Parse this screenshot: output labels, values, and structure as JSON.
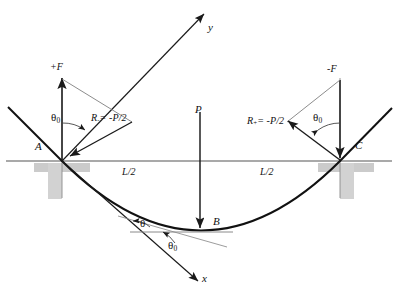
{
  "figure": {
    "background": "#ffffff",
    "stroke_dark": "#1a1a1a",
    "stroke_thin": "#555555",
    "support_fill": "#c9c9c9",
    "axis_color": "#4a4a4a"
  },
  "points": {
    "A": {
      "label": "A",
      "x": 62,
      "y": 161
    },
    "B": {
      "label": "B",
      "x": 200,
      "y": 230
    },
    "C": {
      "label": "C",
      "x": 340,
      "y": 161
    }
  },
  "axes": {
    "y_label": "y",
    "x_label": "x",
    "origin_x": 62,
    "origin_y": 161
  },
  "forces": {
    "left_vertical_label": "+F",
    "right_vertical_label": "-F",
    "load_label": "P",
    "left_reaction": {
      "symbol": "R",
      "subscript": "-",
      "equals": "= -P/2"
    },
    "right_reaction": {
      "symbol": "R",
      "subscript": "+",
      "equals": "= -P/2"
    }
  },
  "angles": {
    "left_theta0": {
      "symbol": "θ",
      "subscript": "0"
    },
    "right_theta0": {
      "symbol": "θ",
      "subscript": "0"
    },
    "bottom_theta": {
      "symbol": "θ"
    },
    "bottom_theta0": {
      "symbol": "θ",
      "subscript": "0"
    }
  },
  "dimensions": {
    "left_span": "L/2",
    "right_span": "L/2"
  }
}
